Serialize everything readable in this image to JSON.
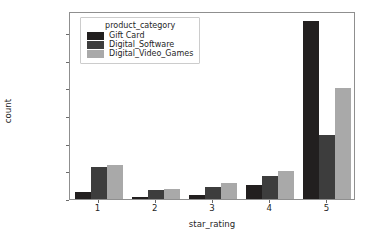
{
  "chart_data": {
    "type": "bar",
    "title": "",
    "xlabel": "star_rating",
    "ylabel": "count",
    "categories": [
      "1",
      "2",
      "3",
      "4",
      "5"
    ],
    "series": [
      {
        "name": "Gift Card",
        "color": "#221f1f",
        "values": [
          5200,
          1400,
          2900,
          9800,
          129000
        ]
      },
      {
        "name": "Digital_Software",
        "color": "#3d3d3d",
        "values": [
          23500,
          6700,
          8400,
          16500,
          46000
        ]
      },
      {
        "name": "Digital_Video_Games",
        "color": "#a9a9a9",
        "values": [
          24800,
          7400,
          11400,
          20200,
          80200
        ]
      }
    ],
    "legend_title": "product_category",
    "legend_position": "upper left",
    "grid": false,
    "ylim": [
      0,
      136000
    ],
    "yticks": [
      0,
      20000,
      40000,
      60000,
      80000,
      100000,
      120000
    ],
    "ytick_labels": [
      "0",
      "20000",
      "40000",
      "60000",
      "80000",
      "100000",
      "120000"
    ],
    "xtick_labels": [
      "1",
      "2",
      "3",
      "4",
      "5"
    ],
    "background_color": "#ffffff",
    "axis_color": "#8f8f8f"
  }
}
